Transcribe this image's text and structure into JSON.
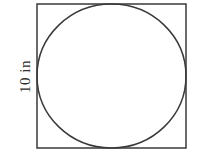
{
  "figure": {
    "type": "geometry-diagram",
    "background_color": "#ffffff",
    "stroke_color": "#3a3a3a",
    "stroke_width": 1.5,
    "square": {
      "name": "outer-square",
      "x": 37,
      "y": 4,
      "width": 149,
      "height": 144,
      "fill": "none"
    },
    "circle": {
      "name": "inscribed-circle",
      "cx": 111.5,
      "cy": 76,
      "rx": 74.5,
      "ry": 72,
      "fill": "none",
      "tangent_sides": [
        "top",
        "right",
        "bottom",
        "left"
      ]
    },
    "labels": {
      "side_length": {
        "text": "10 in",
        "value": 10,
        "unit": "in",
        "rotation_degrees": -90,
        "position": "left-of-square",
        "color": "#2e2e2e"
      }
    }
  }
}
